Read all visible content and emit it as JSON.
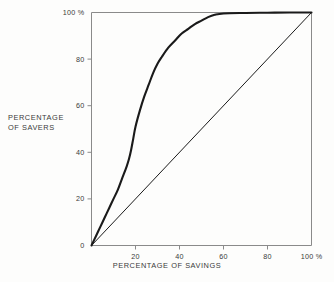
{
  "chart_data": {
    "type": "line",
    "title": "",
    "xlabel": "PERCENTAGE OF SAVINGS",
    "ylabel_line1": "PERCENTAGE",
    "ylabel_line2": "OF SAVERS",
    "xlim": [
      0,
      100
    ],
    "ylim": [
      0,
      100
    ],
    "grid": false,
    "legend": "none",
    "xticks": [
      {
        "value": 0,
        "label": ""
      },
      {
        "value": 20,
        "label": "20"
      },
      {
        "value": 40,
        "label": "40"
      },
      {
        "value": 60,
        "label": "60"
      },
      {
        "value": 80,
        "label": "80"
      },
      {
        "value": 100,
        "label": "100 %"
      }
    ],
    "yticks": [
      {
        "value": 0,
        "label": "0"
      },
      {
        "value": 20,
        "label": "20"
      },
      {
        "value": 40,
        "label": "40"
      },
      {
        "value": 60,
        "label": "60"
      },
      {
        "value": 80,
        "label": "80"
      },
      {
        "value": 100,
        "label": "100 %"
      }
    ],
    "series": [
      {
        "name": "lorenz-curve",
        "color": "#1a1a1a",
        "width": 2.1,
        "x": [
          0,
          2,
          4,
          6,
          8,
          10,
          12,
          14,
          16,
          17,
          18,
          19,
          20,
          22,
          24,
          26,
          28,
          30,
          32,
          35,
          38,
          41,
          44,
          47,
          50,
          53,
          56,
          60,
          70,
          80,
          90,
          100
        ],
        "y": [
          0,
          4,
          8,
          12,
          16,
          20,
          24,
          29,
          34,
          37,
          41,
          46,
          51,
          58,
          64,
          69,
          74,
          78,
          81,
          85,
          88,
          91,
          93,
          95,
          96.5,
          98,
          99,
          99.6,
          99.8,
          99.9,
          100,
          100
        ]
      },
      {
        "name": "line-of-equality",
        "color": "#1a1a1a",
        "width": 1.0,
        "x": [
          0,
          100
        ],
        "y": [
          0,
          100
        ]
      }
    ]
  },
  "axes": {
    "frame_color": "#8a8a8a",
    "tick_color": "#8a8a8a",
    "text_color": "#3a3a3a"
  },
  "background": "#fdfdfc"
}
